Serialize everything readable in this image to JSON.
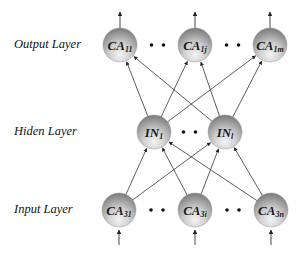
{
  "layers": {
    "output": {
      "label": "Output Layer",
      "nodes": [
        {
          "main": "CA",
          "sub": "11",
          "x": 120,
          "y": 45
        },
        {
          "main": "CA",
          "sub": "1j",
          "x": 195,
          "y": 45
        },
        {
          "main": "CA",
          "sub": "1m",
          "x": 270,
          "y": 45
        }
      ],
      "ellipsis": "• •"
    },
    "hidden": {
      "label": "Hiden Layer",
      "nodes": [
        {
          "main": "IN",
          "sub": "1",
          "x": 154,
          "y": 132
        },
        {
          "main": "IN",
          "sub": "l",
          "x": 225,
          "y": 132
        }
      ],
      "ellipsis": "• •"
    },
    "input": {
      "label": "Input Layer",
      "nodes": [
        {
          "main": "CA",
          "sub": "31",
          "x": 119,
          "y": 210
        },
        {
          "main": "CA",
          "sub": "3i",
          "x": 195,
          "y": 210
        },
        {
          "main": "CA",
          "sub": "3n",
          "x": 271,
          "y": 210
        }
      ],
      "ellipsis": "• •"
    }
  },
  "connections": {
    "input_to_hidden": "fully-connected",
    "hidden_to_output": "fully-connected"
  },
  "colors": {
    "node_dark": "#8a8a8a",
    "node_light": "#f2f2f2",
    "edge": "#333333"
  }
}
